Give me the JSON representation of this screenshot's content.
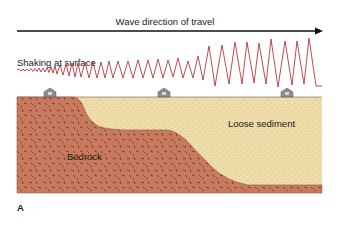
{
  "figure": {
    "panel_label": "A",
    "arrow_label": "Wave direction of travel",
    "shaking_label": "Shaking at surface",
    "layers": {
      "bedrock_label": "Bedrock",
      "sediment_label": "Loose sediment"
    },
    "houses": [
      {
        "name": "house-on-bedrock",
        "x": 50
      },
      {
        "name": "house-on-sediment-middle",
        "x": 164
      },
      {
        "name": "house-on-sediment-right",
        "x": 287
      }
    ],
    "colors": {
      "bedrock": "#c97a5e",
      "bedrock_flecks": "#7a3a26",
      "sediment": "#f0dfaa",
      "sediment_dots": "#a8926a",
      "wave": "#b23a3a",
      "arrow": "#111111",
      "house": "#8a8a8a"
    }
  }
}
